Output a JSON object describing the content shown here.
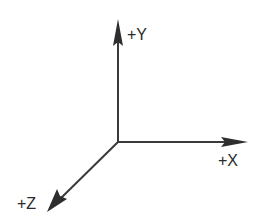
{
  "diagram": {
    "line_color": "#3a3a3a",
    "origin": {
      "x": 118,
      "y": 142
    },
    "axes": [
      {
        "name": "y",
        "label": "+Y",
        "tip": {
          "x": 118,
          "y": 20
        },
        "label_pos": {
          "x": 127,
          "y": 40
        }
      },
      {
        "name": "x",
        "label": "+X",
        "tip": {
          "x": 247,
          "y": 142
        },
        "label_pos": {
          "x": 218,
          "y": 166
        }
      },
      {
        "name": "z",
        "label": "+Z",
        "tip": {
          "x": 48,
          "y": 211
        },
        "label_pos": {
          "x": 17,
          "y": 209
        }
      }
    ]
  }
}
